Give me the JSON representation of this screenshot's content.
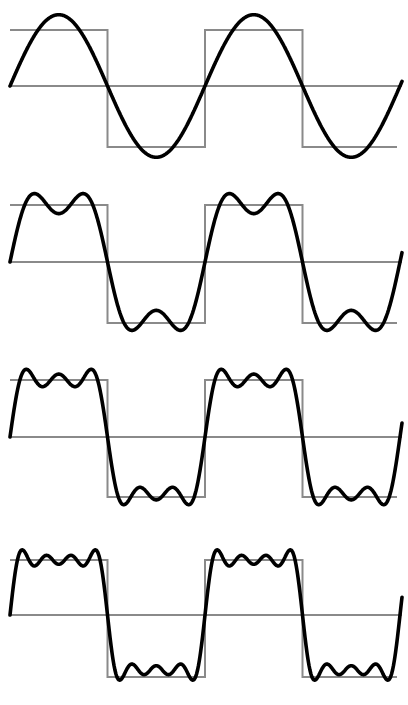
{
  "colors": {
    "square_wave": "#8a8a8a",
    "approximation": "#000000",
    "background": "#ffffff"
  },
  "x_range": {
    "start": 10,
    "end": 402,
    "square_end": 397,
    "period": 195
  },
  "panels": [
    {
      "name": "panel-1-harmonic",
      "harmonics": [
        1
      ],
      "top": 30,
      "mid": 86,
      "bottom": 147
    },
    {
      "name": "panel-2-harmonics",
      "harmonics": [
        1,
        3
      ],
      "top": 205,
      "mid": 262,
      "bottom": 323
    },
    {
      "name": "panel-3-harmonics",
      "harmonics": [
        1,
        3,
        5
      ],
      "top": 380,
      "mid": 437,
      "bottom": 497
    },
    {
      "name": "panel-4-harmonics",
      "harmonics": [
        1,
        3,
        5,
        7
      ],
      "top": 560,
      "mid": 615,
      "bottom": 677
    }
  ]
}
